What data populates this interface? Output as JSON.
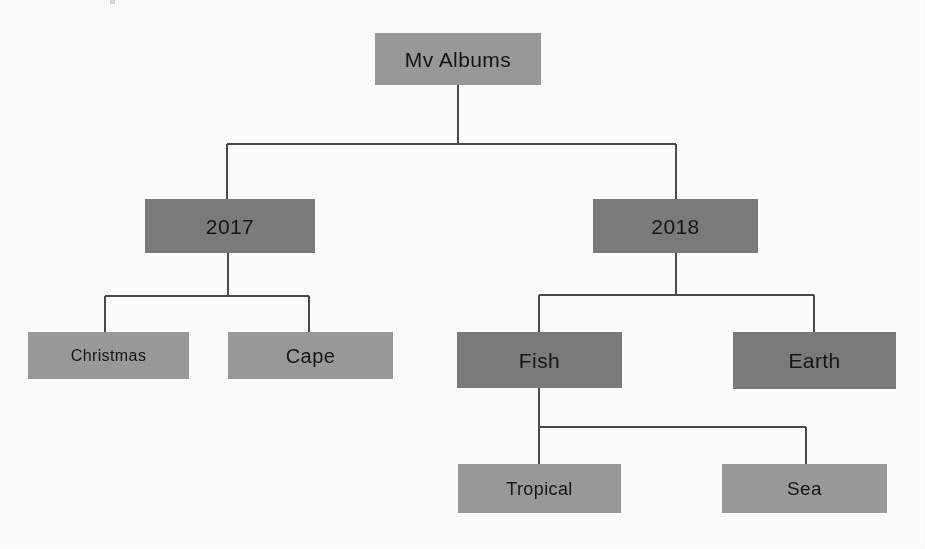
{
  "diagram": {
    "background_color": "#ffffff",
    "connector_color": "#4a4a4a",
    "node_fill_light": "#9b9b9b",
    "node_fill_dark": "#7c7c7c",
    "node_text_color": "#151515",
    "levels": 4
  },
  "nodes": [
    {
      "id": "root",
      "label": "Mv Albums",
      "level": 0,
      "shade": "light",
      "x": 375,
      "y": 33,
      "w": 166,
      "h": 52,
      "font_size": 21,
      "parent": null
    },
    {
      "id": "y2017",
      "label": "2017",
      "level": 1,
      "shade": "dark",
      "x": 145,
      "y": 199,
      "w": 170,
      "h": 54,
      "font_size": 21,
      "parent": "root"
    },
    {
      "id": "y2018",
      "label": "2018",
      "level": 1,
      "shade": "dark",
      "x": 593,
      "y": 199,
      "w": 165,
      "h": 54,
      "font_size": 21,
      "parent": "root"
    },
    {
      "id": "christmas",
      "label": "Christmas",
      "level": 2,
      "shade": "light",
      "x": 28,
      "y": 332,
      "w": 161,
      "h": 47,
      "font_size": 16,
      "parent": "y2017"
    },
    {
      "id": "cape",
      "label": "Cape",
      "level": 2,
      "shade": "light",
      "x": 228,
      "y": 332,
      "w": 165,
      "h": 47,
      "font_size": 20,
      "parent": "y2017"
    },
    {
      "id": "fish",
      "label": "Fish",
      "level": 2,
      "shade": "dark",
      "x": 457,
      "y": 332,
      "w": 165,
      "h": 56,
      "font_size": 21,
      "parent": "y2018"
    },
    {
      "id": "earth",
      "label": "Earth",
      "level": 2,
      "shade": "dark",
      "x": 733,
      "y": 332,
      "w": 163,
      "h": 57,
      "font_size": 21,
      "parent": "y2018"
    },
    {
      "id": "tropical",
      "label": "Tropical",
      "level": 3,
      "shade": "light",
      "x": 458,
      "y": 464,
      "w": 163,
      "h": 49,
      "font_size": 18,
      "parent": "fish"
    },
    {
      "id": "sea",
      "label": "Sea",
      "level": 3,
      "shade": "light",
      "x": 722,
      "y": 464,
      "w": 165,
      "h": 49,
      "font_size": 19,
      "parent": "fish"
    }
  ],
  "connectors": [
    {
      "id": "root-to-years",
      "from": "root",
      "to": [
        "y2017",
        "y2018"
      ],
      "path": "M458,85 L458,144 M227,144 L676,144 M227,144 L227,199 M676,144 L676,199"
    },
    {
      "id": "y2017-children",
      "from": "y2017",
      "to": [
        "christmas",
        "cape"
      ],
      "path": "M228,253 L228,296 M105,296 L309,296 M105,296 L105,332 M309,296 L309,332"
    },
    {
      "id": "y2018-children",
      "from": "y2018",
      "to": [
        "fish",
        "earth"
      ],
      "path": "M676,253 L676,295 M539,295 L814,295 M539,295 L539,332 M814,295 L814,332"
    },
    {
      "id": "fish-children",
      "from": "fish",
      "to": [
        "tropical",
        "sea"
      ],
      "path": "M539,388 L539,464 M539,427 L806,427 M806,427 L806,464"
    }
  ],
  "artifacts": [
    {
      "id": "speck-top",
      "x": 110,
      "y": 0,
      "w": 5,
      "h": 4
    }
  ]
}
